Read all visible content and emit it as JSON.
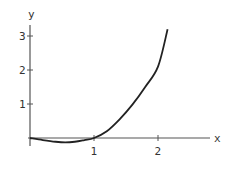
{
  "chart_data": {
    "type": "line",
    "title": "",
    "xlabel": "x",
    "ylabel": "y",
    "xlim": [
      0,
      2.8
    ],
    "ylim": [
      -0.2,
      3.3
    ],
    "grid": false,
    "legend": null,
    "x_ticks": [
      {
        "value": 1,
        "label": "1"
      },
      {
        "value": 2,
        "label": "2"
      }
    ],
    "y_ticks": [
      {
        "value": 1,
        "label": "1"
      },
      {
        "value": 2,
        "label": "2"
      },
      {
        "value": 3,
        "label": "3"
      }
    ],
    "series": [
      {
        "name": "curve",
        "x": [
          0,
          0.2,
          0.4,
          0.55,
          0.7,
          0.85,
          1.0,
          1.2,
          1.4,
          1.6,
          1.8,
          2.0,
          2.15
        ],
        "y": [
          0,
          -0.06,
          -0.11,
          -0.13,
          -0.11,
          -0.06,
          0,
          0.2,
          0.55,
          0.98,
          1.5,
          2.1,
          3.2
        ]
      }
    ]
  }
}
